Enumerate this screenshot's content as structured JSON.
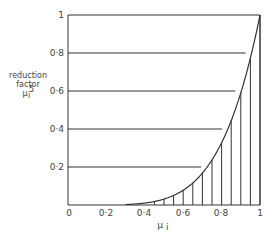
{
  "chart_data": {
    "type": "line",
    "title": "",
    "xlabel": "μ_i",
    "ylabel_lines": [
      "reduction",
      "factor",
      "μ_i^5"
    ],
    "xlim": [
      0,
      1
    ],
    "ylim": [
      0,
      1
    ],
    "x_ticks": [
      "0",
      "0·2",
      "0·4",
      "0·6",
      "0·8",
      "1"
    ],
    "y_ticks": [
      "0·2",
      "0·4",
      "0·6",
      "0·8",
      "1"
    ],
    "grid": "horizontal lines at 0.2, 0.4, 0.6, 0.8 (truncated at curve)",
    "series": [
      {
        "name": "μ^5",
        "function": "y = x^5",
        "x": [
          0,
          0.3,
          0.4,
          0.5,
          0.6,
          0.7,
          0.8,
          0.9,
          1.0
        ],
        "values": [
          0,
          0.0024,
          0.0102,
          0.031,
          0.078,
          0.168,
          0.328,
          0.59,
          1.0
        ]
      }
    ],
    "annotations": "area under curve hatched with vertical lines every 0.05 from 0.45 to 1.0"
  },
  "labels": {
    "ylabel_1": "reduction",
    "ylabel_2": "factor",
    "ylabel_3": "μ",
    "ylabel_sup": "5",
    "ylabel_sub": "i",
    "xlabel": "μ",
    "xlabel_sub": "i",
    "x0": "0",
    "x1": "0·2",
    "x2": "0·4",
    "x3": "0·6",
    "x4": "0·8",
    "x5": "1",
    "y1": "0·2",
    "y2": "0·4",
    "y3": "0·6",
    "y4": "0·8",
    "y5": "1"
  }
}
